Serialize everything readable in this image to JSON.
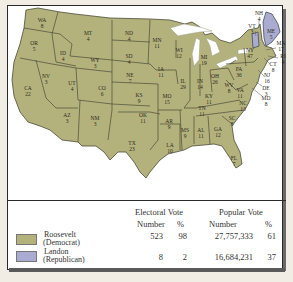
{
  "map": {
    "colors": {
      "democrat": "#b4b27c",
      "republican": "#a9acd0"
    },
    "states": [
      {
        "abbr": "WA",
        "votes": "8",
        "x": 42,
        "y": 22
      },
      {
        "abbr": "OR",
        "votes": "5",
        "x": 34,
        "y": 45
      },
      {
        "abbr": "CA",
        "votes": "22",
        "x": 28,
        "y": 90
      },
      {
        "abbr": "ID",
        "votes": "4",
        "x": 63,
        "y": 55
      },
      {
        "abbr": "NV",
        "votes": "3",
        "x": 46,
        "y": 78
      },
      {
        "abbr": "MT",
        "votes": "4",
        "x": 88,
        "y": 35
      },
      {
        "abbr": "WY",
        "votes": "3",
        "x": 95,
        "y": 62
      },
      {
        "abbr": "UT",
        "votes": "4",
        "x": 72,
        "y": 85
      },
      {
        "abbr": "AZ",
        "votes": "3",
        "x": 67,
        "y": 117
      },
      {
        "abbr": "CO",
        "votes": "6",
        "x": 102,
        "y": 90
      },
      {
        "abbr": "NM",
        "votes": "3",
        "x": 95,
        "y": 120
      },
      {
        "abbr": "ND",
        "votes": "4",
        "x": 129,
        "y": 35
      },
      {
        "abbr": "SD",
        "votes": "4",
        "x": 129,
        "y": 58
      },
      {
        "abbr": "NE",
        "votes": "7",
        "x": 130,
        "y": 77
      },
      {
        "abbr": "KS",
        "votes": "9",
        "x": 139,
        "y": 97
      },
      {
        "abbr": "OK",
        "votes": "11",
        "x": 143,
        "y": 117
      },
      {
        "abbr": "TX",
        "votes": "23",
        "x": 132,
        "y": 145
      },
      {
        "abbr": "MN",
        "votes": "11",
        "x": 157,
        "y": 42
      },
      {
        "abbr": "IA",
        "votes": "11",
        "x": 161,
        "y": 71
      },
      {
        "abbr": "MO",
        "votes": "15",
        "x": 167,
        "y": 98
      },
      {
        "abbr": "AR",
        "votes": "9",
        "x": 169,
        "y": 123
      },
      {
        "abbr": "LA",
        "votes": "10",
        "x": 170,
        "y": 147
      },
      {
        "abbr": "WI",
        "votes": "12",
        "x": 179,
        "y": 52
      },
      {
        "abbr": "IL",
        "votes": "29",
        "x": 183,
        "y": 83
      },
      {
        "abbr": "MS",
        "votes": "9",
        "x": 185,
        "y": 132
      },
      {
        "abbr": "MI",
        "votes": "19",
        "x": 204,
        "y": 59
      },
      {
        "abbr": "IN",
        "votes": "14",
        "x": 200,
        "y": 83
      },
      {
        "abbr": "KY",
        "votes": "11",
        "x": 209,
        "y": 98
      },
      {
        "abbr": "TN",
        "votes": "11",
        "x": 202,
        "y": 110
      },
      {
        "abbr": "AL",
        "votes": "11",
        "x": 201,
        "y": 132
      },
      {
        "abbr": "GA",
        "votes": "12",
        "x": 218,
        "y": 131
      },
      {
        "abbr": "FL",
        "votes": "7",
        "x": 234,
        "y": 160
      },
      {
        "abbr": "OH",
        "votes": "26",
        "x": 215,
        "y": 78
      },
      {
        "abbr": "WV",
        "votes": "8",
        "x": 229,
        "y": 87
      },
      {
        "abbr": "VA",
        "votes": "11",
        "x": 240,
        "y": 92
      },
      {
        "abbr": "NC",
        "votes": "13",
        "x": 243,
        "y": 105
      },
      {
        "abbr": "SC",
        "votes": "8",
        "x": 232,
        "y": 120
      },
      {
        "abbr": "PA",
        "votes": "36",
        "x": 239,
        "y": 71
      },
      {
        "abbr": "NY",
        "votes": "47",
        "x": 250,
        "y": 52
      }
    ],
    "callouts": [
      {
        "abbr": "NH",
        "votes": "4",
        "x": 259,
        "y": 15
      },
      {
        "abbr": "VT",
        "votes": "3",
        "x": 252,
        "y": 28
      },
      {
        "abbr": "ME",
        "votes": "5",
        "x": 271,
        "y": 33
      },
      {
        "abbr": "MA",
        "votes": "17",
        "x": 281,
        "y": 45
      },
      {
        "abbr": "RI",
        "votes": "4",
        "x": 283,
        "y": 58
      },
      {
        "abbr": "CT",
        "votes": "8",
        "x": 273,
        "y": 66
      },
      {
        "abbr": "NJ",
        "votes": "16",
        "x": 267,
        "y": 77
      },
      {
        "abbr": "DE",
        "votes": "3",
        "x": 266,
        "y": 90
      },
      {
        "abbr": "MD",
        "votes": "8",
        "x": 266,
        "y": 100
      }
    ]
  },
  "legend": {
    "headers": {
      "electoral": "Electoral Vote",
      "popular": "Popular Vote",
      "number": "Number",
      "percent": "%"
    },
    "rows": [
      {
        "name": "Roosevelt",
        "party": "(Democrat)",
        "color": "#b4b27c",
        "ev_number": "523",
        "ev_pct": "98",
        "pv_number": "27,757,333",
        "pv_pct": "61"
      },
      {
        "name": "Landon",
        "party": "(Republican)",
        "color": "#a9acd0",
        "ev_number": "8",
        "ev_pct": "2",
        "pv_number": "16,684,231",
        "pv_pct": "37"
      }
    ]
  }
}
